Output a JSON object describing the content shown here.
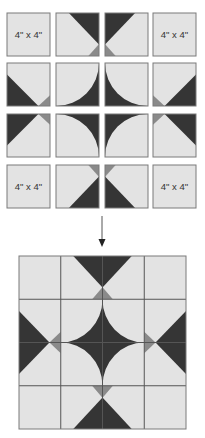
{
  "colors": {
    "light": "#e3e3e3",
    "dark": "#353535",
    "medium": "#8a8a8a",
    "border": "#7a7a7a",
    "gridline": "#555555",
    "arrow": "#222222"
  },
  "top_grid": {
    "label_text": "4\" x 4\"",
    "tile_size": 43,
    "col_x": [
      7,
      56,
      105,
      153
    ],
    "row_y": [
      13,
      63,
      114,
      165
    ],
    "tiles": [
      {
        "row": 0,
        "col": 0,
        "type": "label"
      },
      {
        "row": 0,
        "col": 1,
        "type": "corner",
        "flip_x": false,
        "flip_y": false,
        "orient": "top"
      },
      {
        "row": 0,
        "col": 2,
        "type": "corner",
        "flip_x": true,
        "flip_y": false,
        "orient": "top"
      },
      {
        "row": 0,
        "col": 3,
        "type": "label"
      },
      {
        "row": 1,
        "col": 0,
        "type": "corner",
        "flip_x": false,
        "flip_y": false,
        "orient": "side"
      },
      {
        "row": 1,
        "col": 1,
        "type": "arc",
        "flip_x": false,
        "flip_y": false
      },
      {
        "row": 1,
        "col": 2,
        "type": "arc",
        "flip_x": true,
        "flip_y": false
      },
      {
        "row": 1,
        "col": 3,
        "type": "corner",
        "flip_x": true,
        "flip_y": false,
        "orient": "side"
      },
      {
        "row": 2,
        "col": 0,
        "type": "corner",
        "flip_x": false,
        "flip_y": true,
        "orient": "side"
      },
      {
        "row": 2,
        "col": 1,
        "type": "arc",
        "flip_x": false,
        "flip_y": true
      },
      {
        "row": 2,
        "col": 2,
        "type": "arc",
        "flip_x": true,
        "flip_y": true
      },
      {
        "row": 2,
        "col": 3,
        "type": "corner",
        "flip_x": true,
        "flip_y": true,
        "orient": "side"
      },
      {
        "row": 3,
        "col": 0,
        "type": "label"
      },
      {
        "row": 3,
        "col": 1,
        "type": "corner",
        "flip_x": false,
        "flip_y": true,
        "orient": "top"
      },
      {
        "row": 3,
        "col": 2,
        "type": "corner",
        "flip_x": true,
        "flip_y": true,
        "orient": "top"
      },
      {
        "row": 3,
        "col": 3,
        "type": "label"
      }
    ]
  },
  "arrow": {
    "x": 102,
    "y1": 216,
    "y2": 247,
    "direction": "down"
  },
  "assembled_block": {
    "x": 19,
    "y": 256,
    "width": 167,
    "height": 173,
    "rows": 4,
    "cols": 4
  }
}
